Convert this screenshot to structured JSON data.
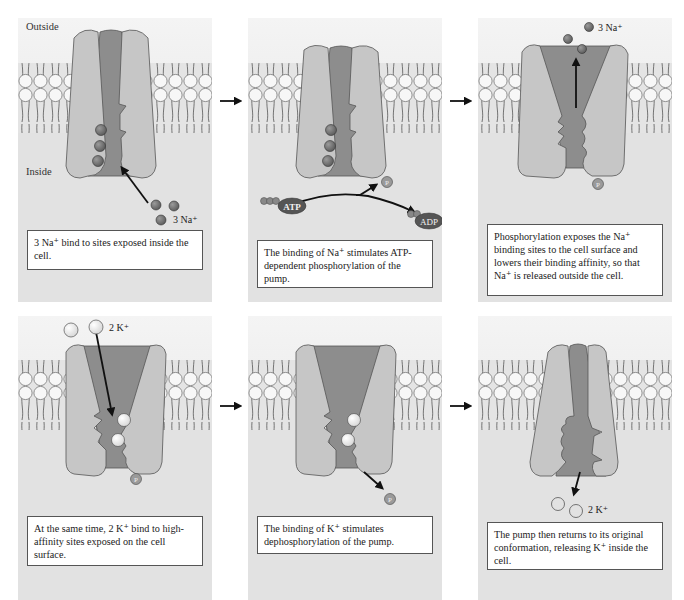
{
  "figure": {
    "labels": {
      "outside": "Outside",
      "inside": "Inside"
    },
    "colors": {
      "panel_bg": "#e2e2e2",
      "outside_bg": "#f1f1f1",
      "pump_light": "#c6c6c6",
      "pump_dark": "#8d8d8d",
      "sodium_ion": "#6f6f6f",
      "potassium_ion": "#ececec",
      "phosphate": "#8a8a8a",
      "atp_oval": "#555555"
    },
    "panels": [
      {
        "step": 1,
        "ion_label": "3 Na⁺",
        "caption": "3 Na⁺ bind to sites exposed inside the cell."
      },
      {
        "step": 2,
        "atp_label": "ATP",
        "adp_label": "ADP",
        "phosphate_label": "P",
        "caption": "The binding of Na⁺ stimulates ATP-dependent phosphorylation of the pump."
      },
      {
        "step": 3,
        "ion_label": "3 Na⁺",
        "phosphate_label": "P",
        "caption": "Phosphorylation exposes the Na⁺ binding sites to the cell surface and lowers their binding affinity, so that Na⁺ is released outside the cell."
      },
      {
        "step": 4,
        "ion_label": "2 K⁺",
        "phosphate_label": "P",
        "caption": "At the same time, 2 K⁺ bind to high-affinity sites exposed on the cell surface."
      },
      {
        "step": 5,
        "phosphate_label": "P",
        "caption": "The binding of K⁺ stimulates dephosphorylation of the pump."
      },
      {
        "step": 6,
        "ion_label": "2 K⁺",
        "caption": "The pump then returns to its original conformation, releasing K⁺ inside the cell."
      }
    ],
    "step_arrows": [
      "arrow-1-to-2",
      "arrow-2-to-3",
      "arrow-4-to-5",
      "arrow-5-to-6"
    ]
  }
}
